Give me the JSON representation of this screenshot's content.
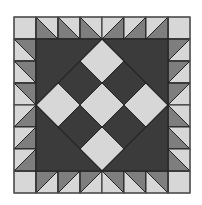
{
  "image": {
    "subject": "Quilt block pattern",
    "description": "Square quilt block with sawtooth half-square-triangle border and on-point checkerboard center"
  },
  "colors": {
    "background": "#ffffff",
    "light": "#d7d7d7",
    "medium": "#7e7e7e",
    "dark": "#3b3b3b",
    "line": "#262626"
  },
  "grid": {
    "origin_x": 14,
    "origin_y": 17,
    "cell": 22,
    "cells": 8
  },
  "border": {
    "corners": [
      "top-left",
      "top-right",
      "bottom-left",
      "bottom-right"
    ],
    "top": [
      {
        "diag": "tl-br",
        "medium": "bl"
      },
      {
        "diag": "tl-br",
        "medium": "bl"
      },
      {
        "diag": "tl-br",
        "medium": "bl"
      },
      {
        "diag": "bl-tr",
        "medium": "br"
      },
      {
        "diag": "bl-tr",
        "medium": "br"
      },
      {
        "diag": "bl-tr",
        "medium": "br"
      }
    ],
    "bottom": [
      {
        "diag": "bl-tr",
        "medium": "tl"
      },
      {
        "diag": "bl-tr",
        "medium": "tl"
      },
      {
        "diag": "bl-tr",
        "medium": "tl"
      },
      {
        "diag": "tl-br",
        "medium": "tr"
      },
      {
        "diag": "tl-br",
        "medium": "tr"
      },
      {
        "diag": "tl-br",
        "medium": "tr"
      }
    ],
    "left": [
      {
        "diag": "tl-br",
        "medium": "tr"
      },
      {
        "diag": "tl-br",
        "medium": "tr"
      },
      {
        "diag": "tl-br",
        "medium": "tr"
      },
      {
        "diag": "bl-tr",
        "medium": "br"
      },
      {
        "diag": "bl-tr",
        "medium": "br"
      },
      {
        "diag": "bl-tr",
        "medium": "br"
      }
    ],
    "right": [
      {
        "diag": "bl-tr",
        "medium": "tl"
      },
      {
        "diag": "bl-tr",
        "medium": "tl"
      },
      {
        "diag": "bl-tr",
        "medium": "tl"
      },
      {
        "diag": "tl-br",
        "medium": "bl"
      },
      {
        "diag": "tl-br",
        "medium": "bl"
      },
      {
        "diag": "tl-br",
        "medium": "bl"
      }
    ]
  },
  "center": {
    "background": "dark",
    "checkerboard_on_point": [
      [
        "light",
        "dark",
        "light"
      ],
      [
        "dark",
        "light",
        "dark"
      ],
      [
        "light",
        "dark",
        "light"
      ]
    ]
  }
}
